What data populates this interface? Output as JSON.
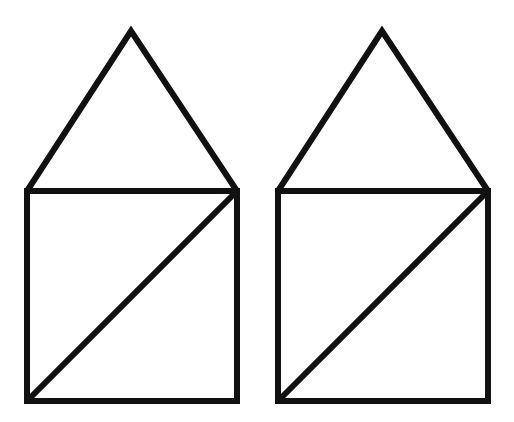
{
  "meta": {
    "domain": "Diagram",
    "width": 514,
    "height": 422,
    "background_color": "#ffffff",
    "stroke_color": "#111111",
    "stroke_width": 6,
    "figure_count": 2
  },
  "figures": [
    {
      "id": "left-house",
      "label": "Left house figure",
      "square": {
        "left": 27,
        "top": 191,
        "right": 237,
        "bottom": 401,
        "width": 210,
        "height": 210
      },
      "roof": {
        "apex_x": 131,
        "apex_y": 31,
        "base_left_x": 27,
        "base_right_x": 237,
        "base_y": 191,
        "height": 160
      },
      "diagonal": {
        "from_x": 27,
        "from_y": 401,
        "to_x": 237,
        "to_y": 191,
        "direction": "bottom-left-to-top-right"
      },
      "square_path": "M27,191 L237,191 L237,401 L27,401 Z",
      "roof_path": "M27,191 L131,31 L237,191",
      "diagonal_path": "M27,401 L237,191"
    },
    {
      "id": "right-house",
      "label": "Right house figure",
      "square": {
        "left": 278,
        "top": 191,
        "right": 488,
        "bottom": 401,
        "width": 210,
        "height": 210
      },
      "roof": {
        "apex_x": 382,
        "apex_y": 31,
        "base_left_x": 278,
        "base_right_x": 488,
        "base_y": 191,
        "height": 160
      },
      "diagonal": {
        "from_x": 278,
        "from_y": 401,
        "to_x": 488,
        "to_y": 191,
        "direction": "bottom-left-to-top-right"
      },
      "square_path": "M278,191 L488,191 L488,401 L278,401 Z",
      "roof_path": "M278,191 L382,31 L488,191",
      "diagonal_path": "M278,401 L488,191"
    }
  ]
}
